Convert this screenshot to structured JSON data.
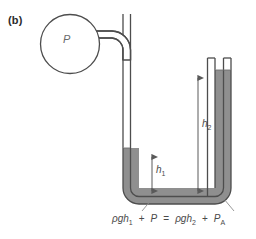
{
  "figure": {
    "panel_label": "(b)",
    "bulb_pressure_symbol": "P",
    "height_labels": {
      "h1": "h",
      "h1_sub": "1",
      "h2": "h",
      "h2_sub": "2"
    },
    "equation": {
      "left_rho": "ρ",
      "left_gh": "gh",
      "left_sub": "1",
      "left_plus": "+",
      "left_p": "P",
      "operator": "=",
      "right_rho": "ρ",
      "right_gh": "gh",
      "right_sub": "2",
      "right_plus": "+",
      "right_p": "P",
      "right_p_sub": "A"
    },
    "colors": {
      "outline": "#4d4d4d",
      "mercury": "#8a8a8a",
      "mercury_light": "#a0a0a0",
      "background": "#ffffff",
      "arrow": "#5a5a5a",
      "text": "#4a4a4a",
      "label_text": "#2b2b2b"
    },
    "description": {
      "apparatus": "manometer",
      "bulb": "gas-bulb",
      "tube": "u-tube",
      "fluid": "mercury"
    }
  }
}
